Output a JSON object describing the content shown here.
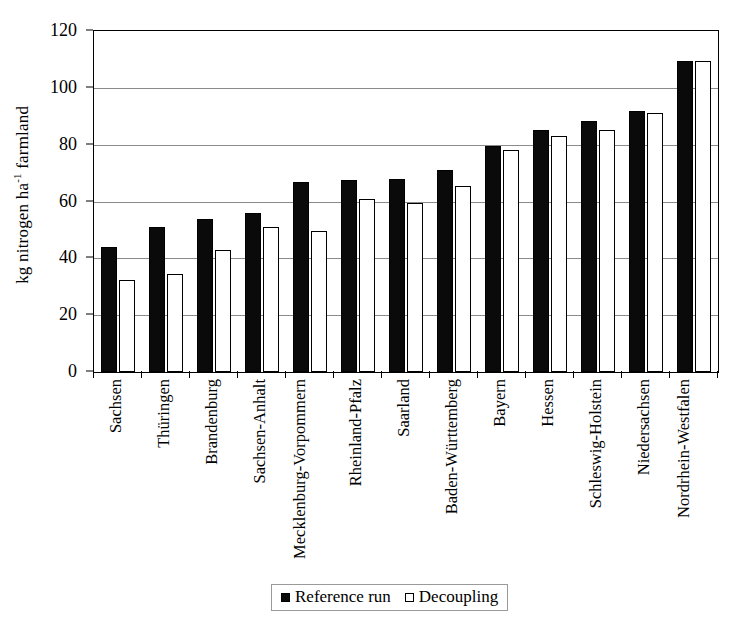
{
  "chart_data": {
    "type": "bar",
    "title": "",
    "xlabel": "",
    "ylabel": "kg nitrogen ha-1 farmland",
    "ylabel_parts": {
      "pre": "kg nitrogen ha",
      "sup": "-1",
      "post": " farmland"
    },
    "ylim": [
      0,
      120
    ],
    "yticks": [
      0,
      20,
      40,
      60,
      80,
      100,
      120
    ],
    "ytick_labels": [
      "0",
      "20",
      "40",
      "60",
      "80",
      "100",
      "120"
    ],
    "grid": true,
    "legend_position": "bottom",
    "categories": [
      "Sachsen",
      "Thüringen",
      "Brandenburg",
      "Sachsen-Anhalt",
      "Mecklenburg-Vorpommern",
      "Rheinland-Pfalz",
      "Saarland",
      "Baden-Württemberg",
      "Bayern",
      "Hessen",
      "Schleswig-Holstein",
      "Niedersachsen",
      "Nordrhein-Westfalen"
    ],
    "series": [
      {
        "name": "Reference run",
        "color": "#0a0a0a",
        "values": [
          44,
          51,
          54,
          56,
          67,
          67.5,
          68,
          71,
          79.5,
          85,
          88.5,
          92,
          109.5
        ]
      },
      {
        "name": "Decoupling",
        "color": "#ffffff",
        "values": [
          32.5,
          34.5,
          43,
          51,
          49.5,
          61,
          59.5,
          65.5,
          78,
          83,
          85,
          91,
          109.5
        ]
      }
    ]
  },
  "legend": {
    "items": [
      {
        "label": "Reference run",
        "style": "ref"
      },
      {
        "label": "Decoupling",
        "style": "dec"
      }
    ]
  }
}
